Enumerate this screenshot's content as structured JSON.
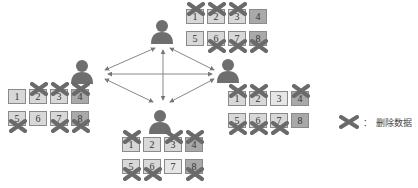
{
  "diagram": {
    "type": "replica-deletion",
    "users": [
      {
        "id": "top",
        "x": 149,
        "y": 18
      },
      {
        "id": "left",
        "x": 69,
        "y": 58
      },
      {
        "id": "right",
        "x": 215,
        "y": 57
      },
      {
        "id": "bottom",
        "x": 147,
        "y": 108
      }
    ],
    "arrows": [
      {
        "from": "top",
        "to": "left"
      },
      {
        "from": "top",
        "to": "right"
      },
      {
        "from": "top",
        "to": "bottom"
      },
      {
        "from": "left",
        "to": "right"
      },
      {
        "from": "left",
        "to": "bottom"
      },
      {
        "from": "right",
        "to": "bottom"
      }
    ],
    "grids": [
      {
        "owner": "top",
        "x": 186,
        "y": 9,
        "cells": [
          {
            "n": "1",
            "shade": "mid",
            "x": "top"
          },
          {
            "n": "2",
            "shade": "mid",
            "x": "top"
          },
          {
            "n": "3",
            "shade": "mid",
            "x": "top"
          },
          {
            "n": "4",
            "shade": "dark",
            "x": ""
          },
          {
            "n": "5",
            "shade": "mid",
            "x": ""
          },
          {
            "n": "6",
            "shade": "mid",
            "x": "bottom"
          },
          {
            "n": "7",
            "shade": "mid",
            "x": "bottom"
          },
          {
            "n": "8",
            "shade": "dark",
            "x": "bottom"
          }
        ]
      },
      {
        "owner": "left",
        "x": 8,
        "y": 89,
        "cells": [
          {
            "n": "1",
            "shade": "mid",
            "x": ""
          },
          {
            "n": "2",
            "shade": "mid",
            "x": "top"
          },
          {
            "n": "3",
            "shade": "mid",
            "x": "top"
          },
          {
            "n": "4",
            "shade": "dark",
            "x": "top"
          },
          {
            "n": "5",
            "shade": "mid",
            "x": "bottom"
          },
          {
            "n": "6",
            "shade": "mid",
            "x": ""
          },
          {
            "n": "7",
            "shade": "mid",
            "x": "bottom"
          },
          {
            "n": "8",
            "shade": "dark",
            "x": "bottom"
          }
        ]
      },
      {
        "owner": "right",
        "x": 228,
        "y": 91,
        "cells": [
          {
            "n": "1",
            "shade": "mid",
            "x": "top"
          },
          {
            "n": "2",
            "shade": "mid",
            "x": "top"
          },
          {
            "n": "3",
            "shade": "light",
            "x": ""
          },
          {
            "n": "4",
            "shade": "dark",
            "x": "top"
          },
          {
            "n": "5",
            "shade": "mid",
            "x": "bottom"
          },
          {
            "n": "6",
            "shade": "mid",
            "x": "bottom"
          },
          {
            "n": "7",
            "shade": "mid",
            "x": "bottom"
          },
          {
            "n": "8",
            "shade": "dark",
            "x": ""
          }
        ]
      },
      {
        "owner": "bottom",
        "x": 122,
        "y": 137,
        "cells": [
          {
            "n": "1",
            "shade": "mid",
            "x": "top"
          },
          {
            "n": "2",
            "shade": "mid",
            "x": ""
          },
          {
            "n": "3",
            "shade": "mid",
            "x": "top"
          },
          {
            "n": "4",
            "shade": "dark",
            "x": "top"
          },
          {
            "n": "5",
            "shade": "mid",
            "x": "bottom"
          },
          {
            "n": "6",
            "shade": "mid",
            "x": "bottom"
          },
          {
            "n": "7",
            "shade": "light",
            "x": ""
          },
          {
            "n": "8",
            "shade": "dark",
            "x": "bottom"
          }
        ]
      }
    ]
  },
  "legend": {
    "icon": "x-mark-icon",
    "separator": "：",
    "label": "删除数据"
  },
  "colors": {
    "user": "#6e6e6e",
    "arrow": "#777777",
    "x_mark": "#6a6a6a",
    "cell_mid": "#d8d8d8",
    "cell_dark": "#a9a9a9",
    "cell_light": "#e6e6e6",
    "cell_border": "#8a8a8a"
  }
}
